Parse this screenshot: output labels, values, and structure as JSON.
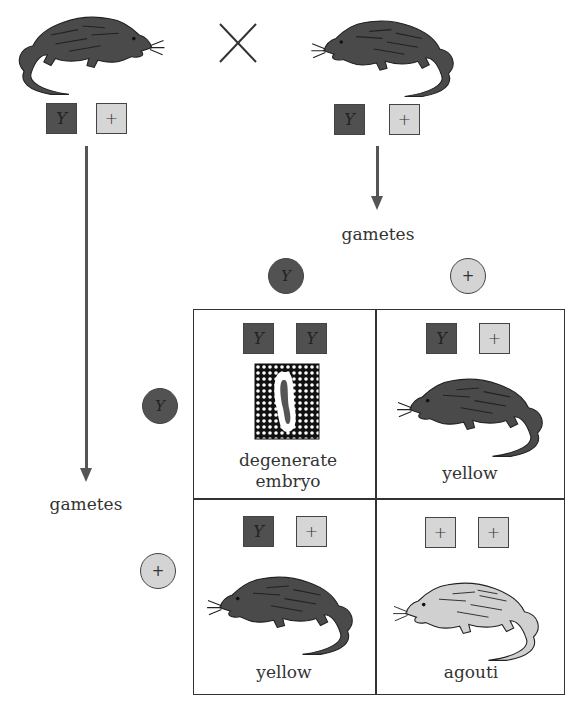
{
  "cross_symbol": "×",
  "parents": [
    {
      "id": "parent-left",
      "phenotype_color": "dark",
      "genotype": [
        "Y",
        "+"
      ]
    },
    {
      "id": "parent-right",
      "phenotype_color": "dark",
      "genotype": [
        "Y",
        "+"
      ]
    }
  ],
  "labels": {
    "gametes_top": "gametes",
    "gametes_left": "gametes"
  },
  "gametes": {
    "columns": [
      "Y",
      "+"
    ],
    "rows": [
      "Y",
      "+"
    ]
  },
  "punnett": {
    "cells": [
      {
        "row": 0,
        "col": 0,
        "genotype": [
          "Y",
          "Y"
        ],
        "outcome": "degenerate embryo",
        "outcome_line1": "degenerate",
        "outcome_line2": "embryo"
      },
      {
        "row": 0,
        "col": 1,
        "genotype": [
          "Y",
          "+"
        ],
        "outcome": "yellow"
      },
      {
        "row": 1,
        "col": 0,
        "genotype": [
          "Y",
          "+"
        ],
        "outcome": "yellow"
      },
      {
        "row": 1,
        "col": 1,
        "genotype": [
          "+",
          "+"
        ],
        "outcome": "agouti"
      }
    ]
  },
  "colors": {
    "dark_allele": "#505050",
    "light_allele": "#d6d6d6",
    "arrow": "#555555",
    "lines": "#333333"
  }
}
